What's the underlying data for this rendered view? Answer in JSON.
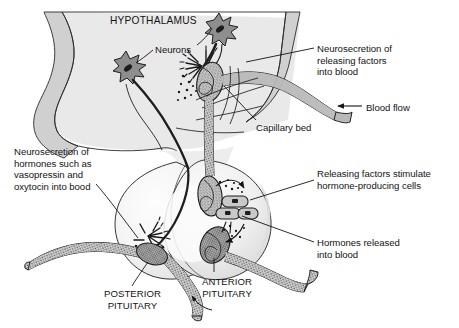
{
  "figure": {
    "title_text": "HYPOTHALAMUS",
    "colors": {
      "ink": "#141414",
      "brain_tissue_fill": "#d2d2d2",
      "hypothalamus_fill": "#e8e8e8",
      "pituitary_fill": "#f2f2f2",
      "pituitary_inner_fill": "#fafafa",
      "capillary_fill": "#b4b4b4",
      "neuron_body_fill": "#8c8c8c",
      "secretory_cell_fill": "#c8c8c8",
      "background": "#ffffff"
    }
  },
  "labels": {
    "hypothalamus": "HYPOTHALAMUS",
    "neurons": "Neurons",
    "neurosecretion_releasing_factors": "Neurosecretion of\nreleasing factors\ninto blood",
    "blood_flow": "Blood flow",
    "capillary_bed": "Capillary bed",
    "neurosecretion_hormones": "Neurosecretion of\nhormones such as\nvasopressin and\noxytocin into bood",
    "releasing_factors_stimulate": "Releasing factors stimulate\nhormone-producing cells",
    "hormones_released": "Hormones released\ninto blood",
    "posterior_pituitary": "POSTERIOR\nPITUITARY",
    "anterior_pituitary": "ANTERIOR\nPITUITARY"
  },
  "diagram_parts": [
    {
      "name": "hypothalamus-body",
      "kind": "anatomical-region"
    },
    {
      "name": "brain-tissue-band",
      "kind": "anatomical-region"
    },
    {
      "name": "posterior-pituitary-lobe",
      "kind": "anatomical-region"
    },
    {
      "name": "anterior-pituitary-lobe",
      "kind": "anatomical-region"
    },
    {
      "name": "neuron-cell-body-upper",
      "kind": "cell"
    },
    {
      "name": "neuron-cell-body-lower",
      "kind": "cell"
    },
    {
      "name": "capillary-bed-upper",
      "kind": "vessel"
    },
    {
      "name": "capillary-bed-lower",
      "kind": "vessel"
    },
    {
      "name": "portal-vessel",
      "kind": "vessel"
    },
    {
      "name": "hormone-producing-cells",
      "kind": "cell"
    },
    {
      "name": "axon-terminal-posterior",
      "kind": "cell-process"
    },
    {
      "name": "axon-terminal-hypothalamic",
      "kind": "cell-process"
    },
    {
      "name": "blood-flow-arrow",
      "kind": "arrow"
    },
    {
      "name": "anterior-pituitary-pointer-arrow",
      "kind": "arrow"
    }
  ]
}
